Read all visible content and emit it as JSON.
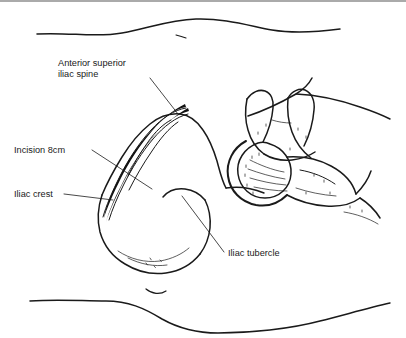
{
  "figure": {
    "background_color": "#ffffff",
    "ink_color": "#1a1a1a",
    "incision_color": "#111111",
    "border_color": "#aaaaaa"
  },
  "labels": [
    {
      "id": "asis",
      "name": "anterior-superior-iliac-spine",
      "line1": "Anterior superior",
      "line2": "iliac spine",
      "text_x": 58,
      "text_y": 64,
      "line_height": 11,
      "leader": "M 150 76 L 178 112"
    },
    {
      "id": "incision",
      "name": "incision-8cm",
      "line1": "Incision 8cm",
      "line2": "",
      "text_x": 14,
      "text_y": 151,
      "line_height": 11,
      "leader": "M 92 148 L 152 187"
    },
    {
      "id": "iliac-crest",
      "name": "iliac-crest",
      "line1": "Iliac crest",
      "line2": "",
      "text_x": 14,
      "text_y": 195,
      "line_height": 11,
      "leader": "M 64 192 L 113 198"
    },
    {
      "id": "iliac-tubercle",
      "name": "iliac-tubercle",
      "line1": "Iliac tubercle",
      "line2": "",
      "text_x": 228,
      "text_y": 254,
      "line_height": 11,
      "leader": "M 224 250 L 182 194"
    }
  ],
  "anatomy": {
    "parts": [
      "iliac wing",
      "iliac crest",
      "anterior superior iliac spine",
      "iliac tubercle",
      "acetabulum",
      "femoral head",
      "greater trochanter",
      "femoral neck",
      "pubic ramus",
      "ischium"
    ]
  },
  "body_contours": {
    "count": 3,
    "note": "torso skin outlines above and below the pelvis"
  }
}
